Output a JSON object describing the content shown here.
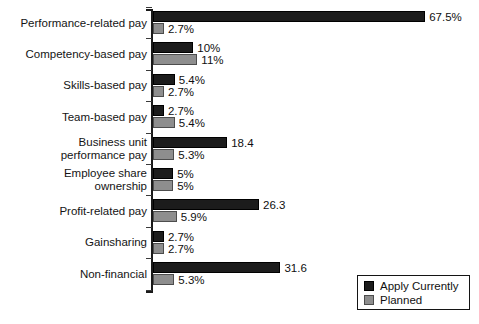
{
  "chart_data": {
    "type": "bar",
    "orientation": "horizontal",
    "title": "",
    "subtitle": "",
    "xlabel": "",
    "ylabel": "",
    "grid": false,
    "xlim": [
      0,
      67.5
    ],
    "axis_ticks_visible": false,
    "legend_position": "bottom-right",
    "categories": [
      "Performance-related pay",
      "Competency-based pay",
      "Skills-based pay",
      "Team-based pay",
      "Business unit\nperformance pay",
      "Employee share\nownership",
      "Profit-related pay",
      "Gainsharing",
      "Non-financial"
    ],
    "series": [
      {
        "name": "Apply Currently",
        "color": "#1c1c1c",
        "values": [
          67.5,
          10,
          5.4,
          2.7,
          18.4,
          5,
          26.3,
          2.7,
          31.6
        ],
        "labels": [
          "67.5%",
          "10%",
          "5.4%",
          "2.7%",
          "18.4",
          "5%",
          "26.3",
          "2.7%",
          "31.6"
        ]
      },
      {
        "name": "Planned",
        "color": "#8e8e8e",
        "values": [
          2.7,
          11,
          2.7,
          5.4,
          5.3,
          5,
          5.9,
          2.7,
          5.3
        ],
        "labels": [
          "2.7%",
          "11%",
          "2.7%",
          "5.4%",
          "5.3%",
          "5%",
          "5.9%",
          "2.7%",
          "5.3%"
        ]
      }
    ]
  },
  "legend": {
    "items": [
      {
        "label": "Apply Currently"
      },
      {
        "label": "Planned"
      }
    ]
  },
  "colors": {
    "current": "#1c1c1c",
    "planned": "#8e8e8e",
    "axis": "#1a1a1a",
    "background": "#ffffff"
  }
}
